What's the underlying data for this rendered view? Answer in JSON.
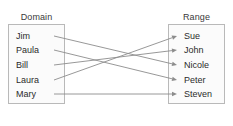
{
  "diagram": {
    "type": "mapping-diagram",
    "domain": {
      "title": "Domain",
      "members": [
        {
          "label": "Jim",
          "y": 36
        },
        {
          "label": "Paula",
          "y": 50
        },
        {
          "label": "Bill",
          "y": 65
        },
        {
          "label": "Laura",
          "y": 80
        },
        {
          "label": "Mary",
          "y": 94
        }
      ]
    },
    "range": {
      "title": "Range",
      "members": [
        {
          "label": "Sue",
          "y": 36
        },
        {
          "label": "John",
          "y": 50
        },
        {
          "label": "Nicole",
          "y": 65
        },
        {
          "label": "Peter",
          "y": 80
        },
        {
          "label": "Steven",
          "y": 94
        }
      ]
    },
    "mappings": [
      {
        "from": "Jim",
        "to": "Nicole",
        "x1": 54,
        "y1": 36,
        "x2": 177,
        "y2": 65
      },
      {
        "from": "Paula",
        "to": "Peter",
        "x1": 54,
        "y1": 50,
        "x2": 177,
        "y2": 80
      },
      {
        "from": "Bill",
        "to": "John",
        "x1": 54,
        "y1": 65,
        "x2": 177,
        "y2": 50
      },
      {
        "from": "Laura",
        "to": "Sue",
        "x1": 54,
        "y1": 80,
        "x2": 177,
        "y2": 36
      },
      {
        "from": "Mary",
        "to": "Steven",
        "x1": 54,
        "y1": 94,
        "x2": 177,
        "y2": 94
      }
    ],
    "colors": {
      "box_border": "#b9b9b9",
      "box_fill": "#fbfbfb",
      "edge": "#8c8c8c",
      "text": "#2b2b2b",
      "title_text": "#3a3a3a",
      "background": "#ffffff"
    }
  }
}
